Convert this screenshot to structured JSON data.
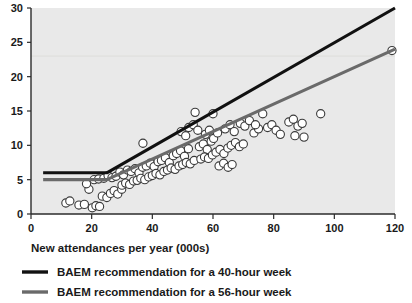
{
  "chart_data": {
    "type": "scatter",
    "title": "",
    "subtitle": "",
    "xlabel": "New attendances per year (000s)",
    "ylabel": "",
    "xlim": [
      0,
      120
    ],
    "ylim": [
      0,
      30
    ],
    "xticks": [
      0,
      20,
      40,
      60,
      80,
      100,
      120
    ],
    "yticks": [
      0,
      5,
      10,
      15,
      20,
      25,
      30
    ],
    "xtick_labels": [
      "0",
      "20",
      "40",
      "60",
      "80",
      "100",
      "120"
    ],
    "ytick_labels": [
      "0",
      "5",
      "10",
      "15",
      "20",
      "25",
      "30"
    ],
    "grid": "horizontal-faint-at-23",
    "gridlines_y": [
      23
    ],
    "legend_position": "below-axis-left",
    "plot_background": "#e9e9e9",
    "series": [
      {
        "name": "BAEM recommendation for a 40-hour week",
        "type": "line",
        "color": "#111111",
        "x": [
          4,
          25,
          120
        ],
        "values": [
          6,
          6,
          30
        ]
      },
      {
        "name": "BAEM recommendation for a 56-hour week",
        "type": "line",
        "color": "#6a6a6a",
        "x": [
          4,
          25,
          120
        ],
        "values": [
          5,
          5,
          24
        ]
      },
      {
        "name": "Departments",
        "type": "scatter",
        "color": "#ffffff",
        "edge_color": "#3a3a3a",
        "points": [
          [
            11.5,
            1.6
          ],
          [
            12.8,
            1.9
          ],
          [
            15.8,
            1.3
          ],
          [
            17.6,
            1.4
          ],
          [
            20.2,
            0.9
          ],
          [
            21.4,
            1.2
          ],
          [
            22.6,
            1.1
          ],
          [
            19.1,
            3.6
          ],
          [
            18.3,
            4.4
          ],
          [
            20.8,
            5.0
          ],
          [
            22.3,
            5.1
          ],
          [
            24.0,
            5.2
          ],
          [
            25.4,
            5.6
          ],
          [
            26.7,
            5.3
          ],
          [
            23.5,
            2.6
          ],
          [
            25.0,
            2.4
          ],
          [
            26.2,
            3.0
          ],
          [
            27.4,
            3.4
          ],
          [
            28.6,
            2.9
          ],
          [
            29.9,
            3.6
          ],
          [
            28.0,
            5.5
          ],
          [
            29.3,
            6.1
          ],
          [
            30.5,
            5.7
          ],
          [
            31.8,
            6.4
          ],
          [
            30.0,
            4.2
          ],
          [
            31.2,
            4.5
          ],
          [
            32.5,
            4.3
          ],
          [
            33.8,
            4.8
          ],
          [
            33.0,
            6.2
          ],
          [
            34.3,
            6.6
          ],
          [
            35.6,
            6.0
          ],
          [
            36.8,
            6.8
          ],
          [
            35.0,
            4.9
          ],
          [
            36.2,
            5.2
          ],
          [
            37.5,
            5.0
          ],
          [
            38.8,
            5.4
          ],
          [
            38.0,
            7.0
          ],
          [
            39.3,
            7.4
          ],
          [
            40.6,
            6.9
          ],
          [
            41.9,
            7.6
          ],
          [
            36.9,
            10.3
          ],
          [
            40.0,
            5.6
          ],
          [
            41.2,
            5.9
          ],
          [
            42.5,
            5.7
          ],
          [
            43.8,
            6.2
          ],
          [
            43.0,
            7.8
          ],
          [
            44.3,
            8.2
          ],
          [
            45.6,
            7.5
          ],
          [
            46.9,
            8.5
          ],
          [
            45.0,
            6.4
          ],
          [
            46.2,
            6.7
          ],
          [
            47.5,
            6.5
          ],
          [
            48.8,
            7.0
          ],
          [
            48.0,
            8.8
          ],
          [
            49.3,
            9.2
          ],
          [
            50.6,
            8.4
          ],
          [
            51.9,
            9.5
          ],
          [
            50.0,
            7.2
          ],
          [
            51.2,
            7.5
          ],
          [
            52.5,
            7.3
          ],
          [
            53.8,
            7.8
          ],
          [
            49.5,
            12.0
          ],
          [
            51.0,
            11.4
          ],
          [
            52.0,
            12.6
          ],
          [
            53.5,
            13.0
          ],
          [
            55.0,
            12.2
          ],
          [
            54.1,
            14.8
          ],
          [
            55.5,
            9.8
          ],
          [
            56.8,
            10.2
          ],
          [
            58.1,
            9.4
          ],
          [
            59.4,
            10.6
          ],
          [
            56.0,
            8.0
          ],
          [
            57.2,
            8.3
          ],
          [
            58.5,
            8.1
          ],
          [
            59.8,
            8.6
          ],
          [
            57.5,
            11.6
          ],
          [
            58.8,
            12.2
          ],
          [
            60.2,
            11.0
          ],
          [
            61.5,
            11.8
          ],
          [
            61.0,
            9.0
          ],
          [
            62.3,
            9.4
          ],
          [
            63.6,
            8.8
          ],
          [
            64.9,
            9.6
          ],
          [
            62.0,
            7.0
          ],
          [
            63.5,
            7.4
          ],
          [
            65.0,
            6.8
          ],
          [
            66.3,
            7.2
          ],
          [
            64.0,
            12.4
          ],
          [
            65.6,
            13.0
          ],
          [
            67.0,
            12.0
          ],
          [
            60.0,
            14.6
          ],
          [
            66.0,
            10.0
          ],
          [
            67.4,
            10.4
          ],
          [
            68.7,
            9.8
          ],
          [
            70.0,
            10.2
          ],
          [
            69.0,
            13.2
          ],
          [
            70.5,
            12.8
          ],
          [
            72.0,
            13.6
          ],
          [
            73.5,
            11.8
          ],
          [
            75.0,
            12.4
          ],
          [
            76.4,
            14.6
          ],
          [
            74.0,
            13.0
          ],
          [
            78.0,
            12.6
          ],
          [
            79.4,
            13.0
          ],
          [
            80.8,
            12.2
          ],
          [
            82.2,
            11.6
          ],
          [
            85.0,
            13.4
          ],
          [
            86.5,
            13.8
          ],
          [
            88.0,
            12.8
          ],
          [
            89.4,
            13.2
          ],
          [
            87.0,
            11.4
          ],
          [
            90.0,
            11.2
          ],
          [
            95.5,
            14.6
          ],
          [
            119.0,
            23.8
          ]
        ]
      }
    ]
  },
  "axis": {
    "x_title": "New attendances per year (000s)"
  },
  "legend": {
    "items": [
      {
        "label": "BAEM recommendation for a 40-hour week",
        "color": "#111111"
      },
      {
        "label": "BAEM recommendation for a 56-hour week",
        "color": "#6a6a6a"
      }
    ]
  }
}
